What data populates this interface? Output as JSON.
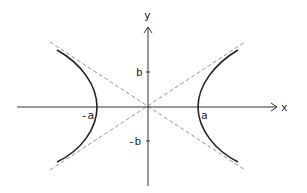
{
  "figure": {
    "type": "hyperbola-diagram",
    "labels": {
      "x_axis": "x",
      "y_axis": "y",
      "b": "b",
      "neg_b": "-b",
      "a": "a",
      "neg_a": "-a"
    },
    "colors": {
      "curve": "#222222",
      "axes": "#333333",
      "asymptote": "#777777",
      "background": "#ffffff"
    },
    "geometry": {
      "origin_px": [
        148,
        107
      ],
      "a_px": 50,
      "b_px": 35,
      "asymptotes": [
        "y = (b/a) x",
        "y = -(b/a) x"
      ]
    }
  }
}
